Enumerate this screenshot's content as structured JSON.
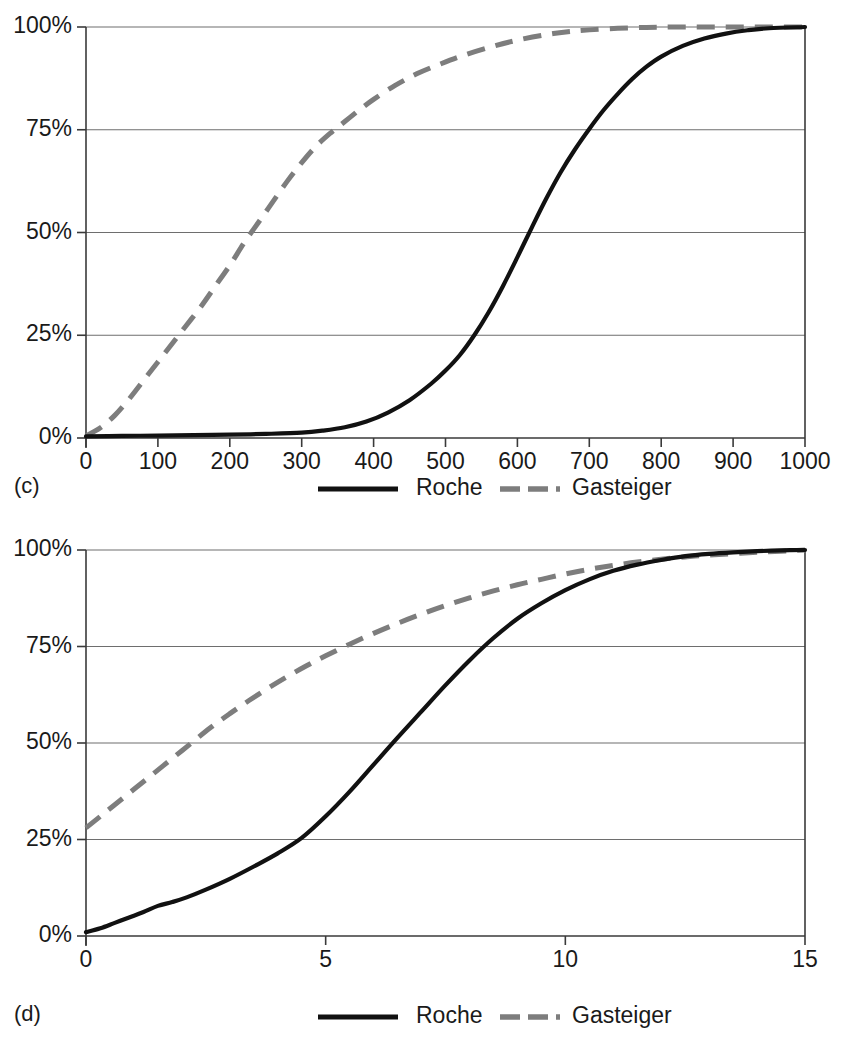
{
  "figure": {
    "background": "#ffffff",
    "ink_color": "#111111",
    "gray_color": "#7d7d7d",
    "grid_color": "#6e6e6e"
  },
  "panels": [
    {
      "id": "c",
      "label": "(c)",
      "legend": [
        {
          "name": "Roche",
          "style": "solid",
          "color": "#111111"
        },
        {
          "name": "Gasteiger",
          "style": "dashed",
          "color": "#7d7d7d"
        }
      ],
      "chart_data": {
        "type": "line",
        "title": "",
        "xlabel": "",
        "ylabel": "",
        "xlim": [
          0,
          1000
        ],
        "ylim": [
          0,
          100
        ],
        "grid": "horizontal",
        "legend_position": "below-axes",
        "xticks": [
          0,
          100,
          200,
          300,
          400,
          500,
          600,
          700,
          800,
          900,
          1000
        ],
        "xticklabels": [
          "0",
          "100",
          "200",
          "300",
          "400",
          "500",
          "600",
          "700",
          "800",
          "900",
          "1000"
        ],
        "yticks": [
          0,
          25,
          50,
          75,
          100
        ],
        "yticklabels": [
          "0%",
          "25%",
          "50%",
          "75%",
          "100%"
        ],
        "series": [
          {
            "name": "Roche",
            "x": [
              0,
              50,
              100,
              150,
              200,
              250,
              300,
              330,
              360,
              390,
              420,
              450,
              480,
              500,
              520,
              540,
              560,
              580,
              600,
              620,
              640,
              660,
              680,
              700,
              720,
              740,
              760,
              780,
              800,
              830,
              860,
              890,
              920,
              950,
              1000
            ],
            "y": [
              0.4,
              0.5,
              0.6,
              0.7,
              0.8,
              1.0,
              1.3,
              1.8,
              2.6,
              4.0,
              6.2,
              9.2,
              13.2,
              16.4,
              20.2,
              25.0,
              30.6,
              37.0,
              44.0,
              51.2,
              58.2,
              64.6,
              70.2,
              75.2,
              79.8,
              83.8,
              87.4,
              90.4,
              92.8,
              95.4,
              97.2,
              98.4,
              99.2,
              99.7,
              100.0
            ]
          },
          {
            "name": "Gasteiger",
            "x": [
              0,
              20,
              40,
              60,
              80,
              100,
              120,
              140,
              160,
              180,
              200,
              220,
              240,
              260,
              280,
              300,
              320,
              340,
              360,
              380,
              400,
              430,
              460,
              490,
              520,
              560,
              600,
              650,
              700,
              760,
              820,
              900,
              1000
            ],
            "y": [
              0.5,
              2.5,
              5.5,
              9.5,
              14.0,
              18.5,
              23.0,
              27.5,
              32.0,
              37.0,
              42.0,
              47.5,
              52.5,
              57.5,
              62.5,
              67.0,
              71.0,
              74.2,
              77.0,
              79.8,
              82.4,
              85.8,
              88.6,
              90.8,
              92.8,
              95.0,
              96.8,
              98.4,
              99.3,
              99.8,
              100.0,
              100.0,
              100.0
            ]
          }
        ]
      }
    },
    {
      "id": "d",
      "label": "(d)",
      "legend": [
        {
          "name": "Roche",
          "style": "solid",
          "color": "#111111"
        },
        {
          "name": "Gasteiger",
          "style": "dashed",
          "color": "#7d7d7d"
        }
      ],
      "chart_data": {
        "type": "line",
        "title": "",
        "xlabel": "",
        "ylabel": "",
        "xlim": [
          0,
          15
        ],
        "ylim": [
          0,
          100
        ],
        "grid": "horizontal",
        "legend_position": "below-axes",
        "xticks": [
          0,
          5,
          10,
          15
        ],
        "xticklabels": [
          "0",
          "5",
          "10",
          "15"
        ],
        "yticks": [
          0,
          25,
          50,
          75,
          100
        ],
        "yticklabels": [
          "0%",
          "25%",
          "50%",
          "75%",
          "100%"
        ],
        "series": [
          {
            "name": "Roche",
            "x": [
              0,
              0.3,
              0.6,
              0.9,
              1.2,
              1.5,
              1.8,
              2.1,
              2.5,
              3.0,
              3.5,
              4.0,
              4.5,
              5.0,
              5.5,
              6.0,
              6.5,
              7.0,
              7.5,
              8.0,
              8.5,
              9.0,
              9.5,
              10.0,
              10.5,
              11.0,
              11.5,
              12.0,
              12.5,
              13.0,
              13.5,
              14.0,
              14.5,
              15.0
            ],
            "y": [
              1.0,
              2.0,
              3.4,
              4.8,
              6.2,
              7.8,
              8.8,
              10.0,
              12.0,
              14.8,
              18.0,
              21.4,
              25.4,
              31.0,
              37.4,
              44.4,
              51.4,
              58.2,
              65.0,
              71.4,
              77.2,
              82.2,
              86.2,
              89.6,
              92.4,
              94.6,
              96.2,
              97.4,
              98.4,
              99.0,
              99.4,
              99.7,
              99.9,
              100.0
            ]
          },
          {
            "name": "Gasteiger",
            "x": [
              0,
              0.3,
              0.6,
              1.0,
              1.4,
              1.8,
              2.2,
              2.6,
              3.0,
              3.4,
              3.8,
              4.2,
              4.6,
              5.0,
              5.5,
              6.0,
              6.5,
              7.0,
              7.5,
              8.0,
              8.5,
              9.0,
              9.5,
              10.0,
              10.5,
              11.0,
              11.5,
              12.0,
              12.5,
              13.0,
              14.0,
              15.0
            ],
            "y": [
              28.0,
              31.0,
              34.0,
              38.0,
              42.0,
              46.0,
              50.0,
              54.0,
              57.6,
              61.0,
              64.2,
              67.2,
              70.0,
              72.6,
              75.6,
              78.4,
              81.0,
              83.4,
              85.6,
              87.6,
              89.4,
              91.0,
              92.4,
              93.8,
              95.0,
              96.0,
              96.9,
              97.6,
              98.2,
              98.7,
              99.4,
              100.0
            ]
          }
        ]
      }
    }
  ]
}
